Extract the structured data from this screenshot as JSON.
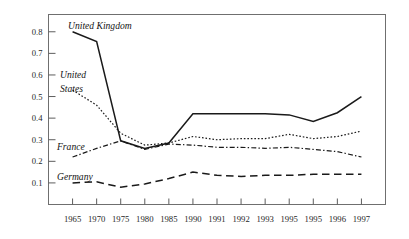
{
  "chart_data": {
    "type": "line",
    "title": "",
    "subtitle": "",
    "xlabel": "",
    "ylabel": "",
    "grid": false,
    "legend_position": "inline-labels",
    "categories": [
      "1965",
      "1970",
      "1975",
      "1980",
      "1985",
      "1990",
      "1991",
      "1992",
      "1993",
      "1995",
      "1995",
      "1996",
      "1997"
    ],
    "ylim": [
      0.0,
      0.88
    ],
    "ytick_labels": [
      "0.1",
      "0.2",
      "0.3",
      "0.4",
      "0.5",
      "0.6",
      "0.7",
      "0.8"
    ],
    "ytick_values": [
      0.1,
      0.2,
      0.3,
      0.4,
      0.5,
      0.6,
      0.7,
      0.8
    ],
    "series": [
      {
        "name": "United Kingdom",
        "style": "solid",
        "values": [
          0.8,
          0.755,
          0.295,
          0.26,
          0.285,
          0.42,
          0.42,
          0.42,
          0.42,
          0.415,
          0.385,
          0.425,
          0.5
        ]
      },
      {
        "name": "United States",
        "style": "dotted",
        "values": [
          0.53,
          0.46,
          0.33,
          0.275,
          0.285,
          0.315,
          0.3,
          0.305,
          0.305,
          0.325,
          0.305,
          0.315,
          0.34
        ]
      },
      {
        "name": "France",
        "style": "dash-dot",
        "values": [
          0.22,
          0.26,
          0.295,
          0.255,
          0.28,
          0.275,
          0.265,
          0.265,
          0.26,
          0.265,
          0.255,
          0.245,
          0.22
        ]
      },
      {
        "name": "Germany",
        "style": "long-dash",
        "values": [
          0.1,
          0.105,
          0.08,
          0.095,
          0.12,
          0.15,
          0.135,
          0.13,
          0.135,
          0.135,
          0.14,
          0.14,
          0.14
        ]
      }
    ],
    "annotations": [
      {
        "text": "United Kingdom",
        "series": "United Kingdom"
      },
      {
        "text": "United States",
        "series": "United States"
      },
      {
        "text": "France",
        "series": "France"
      },
      {
        "text": "Germany",
        "series": "Germany"
      }
    ]
  },
  "labels": {
    "united_kingdom": "United Kingdom",
    "united_states_line1": "United",
    "united_states_line2": "States",
    "france": "France",
    "germany": "Germany"
  }
}
